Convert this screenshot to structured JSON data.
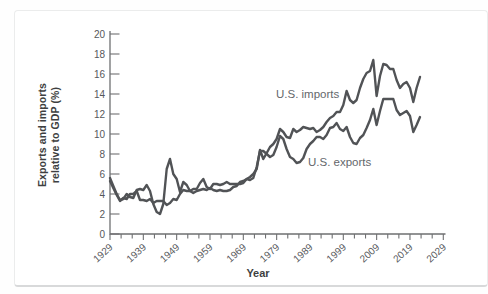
{
  "chart": {
    "y_axis_title_line1": "Exports and imports",
    "y_axis_title_line2": "relative to GDP (%)"
  },
  "chart_data": {
    "type": "line",
    "title": "",
    "xlabel": "Year",
    "ylabel": "Exports and imports relative to GDP (%)",
    "legend": "inline-labels-on-chart",
    "grid": false,
    "line_color": "#515356",
    "axis_color": "#6f7072",
    "tick_label_color": "#56585b",
    "x_axis": {
      "min": 1929,
      "max": 2029,
      "labeled_tick_interval_years": 10,
      "minor_ticks_per_decade": 3,
      "tick_labels": [
        "1929",
        "1939",
        "1949",
        "1959",
        "1969",
        "1979",
        "1989",
        "1999",
        "2009",
        "2019",
        "2029"
      ]
    },
    "y_axis": {
      "min": 0,
      "max": 20,
      "tick_interval": 2,
      "tick_labels": [
        "0",
        "2",
        "4",
        "6",
        "8",
        "10",
        "12",
        "14",
        "16",
        "18",
        "20"
      ]
    },
    "x_range": {
      "start": 1929,
      "end": 2022,
      "step": 1
    },
    "series": [
      {
        "name": "U.S. imports",
        "label_placement": "above line, around 1979-1997",
        "values": [
          5.3,
          4.6,
          3.9,
          3.3,
          3.6,
          3.5,
          4.0,
          4.0,
          4.3,
          3.4,
          3.4,
          3.3,
          3.5,
          3.1,
          3.3,
          3.3,
          3.3,
          2.9,
          3.1,
          3.5,
          3.4,
          4.0,
          4.4,
          4.3,
          4.3,
          4.1,
          4.3,
          4.4,
          4.5,
          4.4,
          4.6,
          4.4,
          4.3,
          4.4,
          4.3,
          4.3,
          4.4,
          4.7,
          4.8,
          5.2,
          5.3,
          5.5,
          5.7,
          6.0,
          6.5,
          8.4,
          7.5,
          8.1,
          8.7,
          9.0,
          9.5,
          10.5,
          10.2,
          9.7,
          9.6,
          10.5,
          10.2,
          10.4,
          10.7,
          10.6,
          10.5,
          10.6,
          10.2,
          10.4,
          10.7,
          11.2,
          11.6,
          11.8,
          12.2,
          12.2,
          12.9,
          14.3,
          13.4,
          13.1,
          13.4,
          14.6,
          15.5,
          16.1,
          16.3,
          17.4,
          13.8,
          15.8,
          17.0,
          16.9,
          16.5,
          16.5,
          15.4,
          14.6,
          15.0,
          15.2,
          14.6,
          13.2,
          14.6,
          15.7
        ]
      },
      {
        "name": "U.S. exports",
        "label_placement": "below line, around 1988-2007",
        "values": [
          5.6,
          4.8,
          4.0,
          3.4,
          3.5,
          4.0,
          3.7,
          3.6,
          4.4,
          4.5,
          4.4,
          4.9,
          4.3,
          3.0,
          2.2,
          2.0,
          3.0,
          6.5,
          7.5,
          6.0,
          5.5,
          4.2,
          5.2,
          4.9,
          4.3,
          4.5,
          4.5,
          5.1,
          5.5,
          4.7,
          4.5,
          5.0,
          5.0,
          4.9,
          5.0,
          5.2,
          5.0,
          5.0,
          5.0,
          5.0,
          5.1,
          5.5,
          5.4,
          5.6,
          6.7,
          8.3,
          8.3,
          8.0,
          7.7,
          7.9,
          8.7,
          9.8,
          9.5,
          8.5,
          7.7,
          7.5,
          7.1,
          7.2,
          7.6,
          8.5,
          9.0,
          9.3,
          9.7,
          9.7,
          9.5,
          9.9,
          10.6,
          10.7,
          11.1,
          10.5,
          10.3,
          10.7,
          9.7,
          9.1,
          9.0,
          9.6,
          9.9,
          10.6,
          11.4,
          12.5,
          10.9,
          12.3,
          13.5,
          13.5,
          13.5,
          13.5,
          12.4,
          11.9,
          12.1,
          12.3,
          11.8,
          10.2,
          10.9,
          11.7
        ]
      }
    ]
  }
}
